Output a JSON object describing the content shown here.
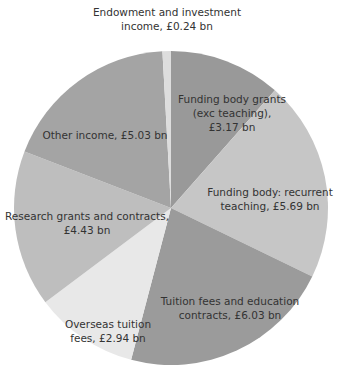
{
  "chart_data": {
    "type": "pie",
    "title": "",
    "unit": "£ bn",
    "start_angle_deg": 0,
    "direction": "clockwise",
    "center": [
      171,
      208
    ],
    "radius": 157,
    "slices": [
      {
        "label": "Funding body grants (exc teaching)",
        "value": 3.17,
        "display": [
          "Funding body grants",
          "(exc teaching),",
          "£3.17 bn"
        ],
        "color": "#999999",
        "label_pos": [
          232,
          92
        ]
      },
      {
        "label": "Funding body: recurrent teaching",
        "value": 5.69,
        "display": [
          "Funding body: recurrent",
          "teaching, £5.69 bn"
        ],
        "color": "#c6c6c6",
        "label_pos": [
          270,
          185
        ]
      },
      {
        "label": "Tuition fees and education contracts",
        "value": 6.03,
        "display": [
          "Tuition fees and education",
          "contracts, £6.03 bn"
        ],
        "color": "#9b9b9b",
        "label_pos": [
          230,
          294
        ]
      },
      {
        "label": "Overseas tuition fees",
        "value": 2.94,
        "display": [
          "Overseas tuition",
          "fees, £2.94 bn"
        ],
        "color": "#e8e8e8",
        "label_pos": [
          108,
          317
        ]
      },
      {
        "label": "Research grants and contracts",
        "value": 4.43,
        "display": [
          "Research grants and contracts,",
          "£4.43 bn"
        ],
        "color": "#bebebe",
        "label_pos": [
          87,
          209
        ]
      },
      {
        "label": "Other income",
        "value": 5.03,
        "display": [
          "Other income, £5.03 bn"
        ],
        "color": "#a4a4a4",
        "label_pos": [
          105,
          128
        ]
      },
      {
        "label": "Endowment and investment income",
        "value": 0.24,
        "display": [
          "Endowment and investment",
          "income, £0.24 bn"
        ],
        "color": "#dddddd",
        "label_pos": [
          167,
          5
        ]
      }
    ]
  }
}
